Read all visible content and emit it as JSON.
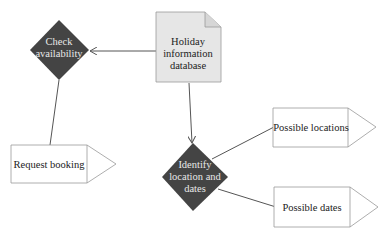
{
  "diagram": {
    "nodes": {
      "check_availability": {
        "lines": [
          "Check",
          "availability"
        ],
        "shape": "diamond",
        "fill": "#444444"
      },
      "holiday_db": {
        "lines": [
          "Holiday",
          "information",
          "database"
        ],
        "shape": "document",
        "fill": "#e6e6e6"
      },
      "request_booking": {
        "lines": [
          "Request booking"
        ],
        "shape": "pentagon-arrow",
        "fill": "#ffffff"
      },
      "identify": {
        "lines": [
          "Identify",
          "location and",
          "dates"
        ],
        "shape": "diamond",
        "fill": "#444444"
      },
      "possible_locations": {
        "lines": [
          "Possible locations"
        ],
        "shape": "pentagon-arrow",
        "fill": "#ffffff"
      },
      "possible_dates": {
        "lines": [
          "Possible dates"
        ],
        "shape": "pentagon-arrow",
        "fill": "#ffffff"
      }
    },
    "edges": [
      {
        "from": "holiday_db",
        "to": "check_availability",
        "arrow": true
      },
      {
        "from": "check_availability",
        "to": "request_booking",
        "arrow": false
      },
      {
        "from": "holiday_db",
        "to": "identify",
        "arrow": true
      },
      {
        "from": "identify",
        "to": "possible_locations",
        "arrow": false
      },
      {
        "from": "identify",
        "to": "possible_dates",
        "arrow": false
      }
    ],
    "colors": {
      "line": "#555555",
      "dark_fill": "#444444",
      "doc_fill": "#e6e6e6",
      "border": "#888888"
    }
  }
}
